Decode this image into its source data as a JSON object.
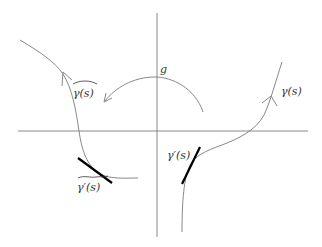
{
  "diagram": {
    "labels": {
      "g": "g",
      "gamma_tilde": "γ(s)",
      "gamma_tilde_prime": "γ′(s)",
      "gamma": "γ(s)",
      "gamma_prime": "γ′(s)"
    },
    "colors": {
      "axis": "#888888",
      "curve": "#888888",
      "tangent": "#000000",
      "text": "#333333"
    }
  }
}
